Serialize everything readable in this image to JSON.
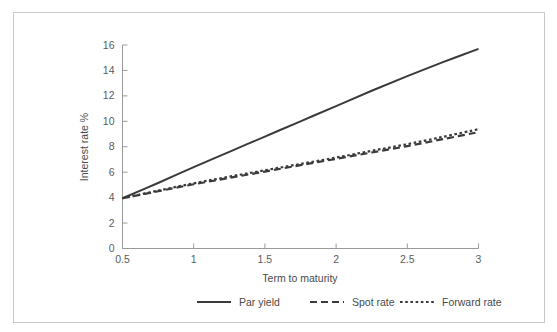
{
  "figure": {
    "background_color": "#ffffff",
    "frame_color": "#c9c9c9",
    "axis_color": "#9a9a9a",
    "text_color": "#4a4a4a"
  },
  "chart_data": {
    "type": "line",
    "title": "",
    "subtitle": "",
    "xlabel": "Term to maturity",
    "ylabel": "Interest rate %",
    "xlim": [
      0.5,
      3
    ],
    "ylim": [
      0,
      16
    ],
    "grid": false,
    "legend_position": "bottom",
    "xticks": [
      0.5,
      1,
      1.5,
      2,
      2.5,
      3
    ],
    "xticklabels": [
      "0.5",
      "1",
      "1.5",
      "2",
      "2.5",
      "3"
    ],
    "yticks": [
      0,
      2,
      4,
      6,
      8,
      10,
      12,
      14,
      16
    ],
    "yticklabels": [
      "0",
      "2",
      "4",
      "6",
      "8",
      "10",
      "12",
      "14",
      "16"
    ],
    "x": [
      0.5,
      0.75,
      1.0,
      1.25,
      1.5,
      1.75,
      2.0,
      2.25,
      2.5,
      2.75,
      3.0
    ],
    "series": [
      {
        "name": "Par yield",
        "style": "solid",
        "color": "#3a3a3a",
        "width": 2.0,
        "values": [
          3.95,
          5.15,
          6.4,
          7.6,
          8.8,
          10.0,
          11.2,
          12.4,
          13.55,
          14.65,
          15.7
        ]
      },
      {
        "name": "Spot rate",
        "style": "dashed",
        "color": "#3a3a3a",
        "width": 2.2,
        "values": [
          3.95,
          4.5,
          5.05,
          5.55,
          6.05,
          6.55,
          7.05,
          7.55,
          8.05,
          8.6,
          9.15
        ]
      },
      {
        "name": "Forward rate",
        "style": "dotted",
        "color": "#3a3a3a",
        "width": 2.2,
        "values": [
          3.95,
          4.55,
          5.12,
          5.65,
          6.15,
          6.65,
          7.15,
          7.68,
          8.2,
          8.78,
          9.38
        ]
      }
    ]
  },
  "legend": {
    "items": [
      {
        "label": "Par yield",
        "marker": "solid-line-swatch"
      },
      {
        "label": "Spot rate",
        "marker": "dashed-line-swatch"
      },
      {
        "label": "Forward rate",
        "marker": "dotted-line-swatch"
      }
    ]
  }
}
